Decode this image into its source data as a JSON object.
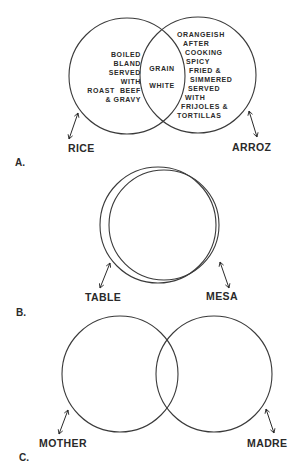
{
  "diagrams": [
    {
      "id": "A",
      "section_label": "A.",
      "left_label": "RICE",
      "right_label": "ARROZ",
      "left_only": [
        "BOILED",
        "BLAND",
        "SERVED",
        "WITH",
        "ROAST  BEEF",
        "& GRAVY"
      ],
      "overlap": [
        "GRAIN",
        "WHITE"
      ],
      "right_only": [
        "ORANGEISH",
        "AFTER",
        "COOKING",
        "SPICY",
        "FRIED &",
        "SIMMERED",
        "SERVED",
        "WITH",
        "FRIJOLES &",
        "TORTILLAS"
      ]
    },
    {
      "id": "B",
      "section_label": "B.",
      "left_label": "TABLE",
      "right_label": "MESA"
    },
    {
      "id": "C",
      "section_label": "C.",
      "left_label": "MOTHER",
      "right_label": "MADRE"
    }
  ]
}
